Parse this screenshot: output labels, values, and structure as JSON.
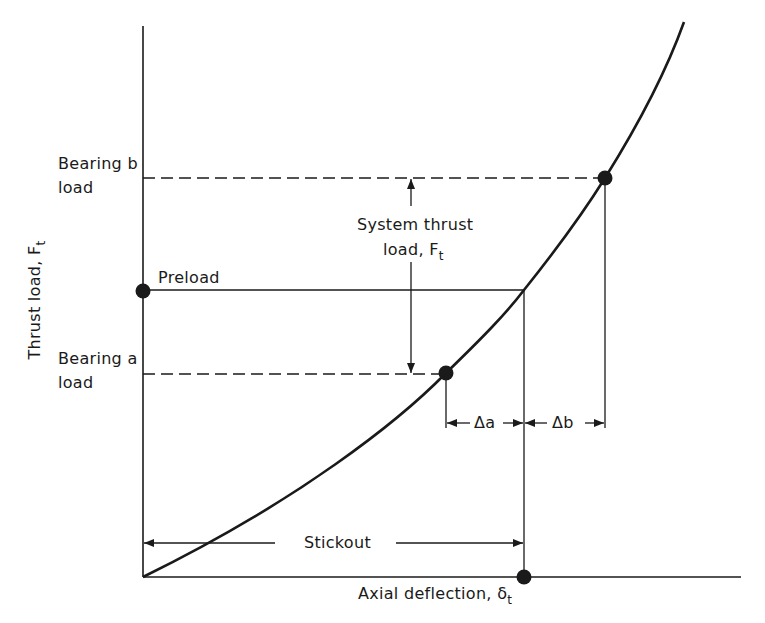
{
  "diagram": {
    "type": "load-deflection curve (bearing preload)",
    "y_axis_label": "Thrust load, F",
    "y_axis_sub": "t",
    "x_axis_label": "Axial deflection, δ",
    "x_axis_sub": "t",
    "labels": {
      "bearing_b_line1": "Bearing b",
      "bearing_b_line2": "load",
      "bearing_a_line1": "Bearing a",
      "bearing_a_line2": "load",
      "preload": "Preload",
      "system_thrust_line1": "System thrust",
      "system_thrust_line2": "load, F",
      "system_thrust_sub": "t",
      "delta_a": "Δa",
      "delta_b": "Δb",
      "stickout": "Stickout"
    },
    "points": [
      {
        "name": "preload-point",
        "x": 143,
        "y": 291
      },
      {
        "name": "bearing-a-point",
        "x": 446,
        "y": 373
      },
      {
        "name": "bearing-b-point",
        "x": 605,
        "y": 178
      },
      {
        "name": "deflection-point",
        "x": 524,
        "y": 577
      }
    ],
    "colors": {
      "ink": "#1a1a1a",
      "background": "#ffffff"
    }
  }
}
